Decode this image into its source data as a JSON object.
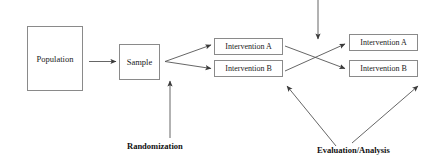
{
  "diagram": {
    "canvas": {
      "width": 440,
      "height": 167,
      "background": "#ffffff"
    },
    "stroke_color": "#555555",
    "box_border_color": "#8a8a8a",
    "text_color": "#1a1a1a",
    "nodes": {
      "population": "Population",
      "sample": "Sample",
      "mid_intervention_a": "Intervention A",
      "mid_intervention_b": "Intervention B",
      "right_intervention_a": "Intervention A",
      "right_intervention_b": "Intervention B"
    },
    "captions": {
      "randomization": "Randomization",
      "evaluation": "Evaluation/Analysis"
    },
    "edges": [
      {
        "name": "population-to-sample",
        "from": "population",
        "to": "sample",
        "style": "straight-arrow"
      },
      {
        "name": "sample-to-mid-a",
        "from": "sample",
        "to": "mid_intervention_a",
        "style": "straight-arrow"
      },
      {
        "name": "sample-to-mid-b",
        "from": "sample",
        "to": "mid_intervention_b",
        "style": "straight-arrow"
      },
      {
        "name": "randomization-to-sample",
        "from": "randomization",
        "to": "sample",
        "style": "straight-arrow"
      },
      {
        "name": "crossover-a-to-b",
        "from": "mid_intervention_a",
        "to": "right_intervention_b",
        "style": "straight-arrow"
      },
      {
        "name": "crossover-b-to-a",
        "from": "mid_intervention_b",
        "to": "right_intervention_a",
        "style": "straight-arrow"
      },
      {
        "name": "washout-top-inflow",
        "from": "top-edge",
        "to": "crossover-point",
        "style": "straight-arrow"
      },
      {
        "name": "evaluation-to-mid",
        "from": "evaluation",
        "to": "mid_intervention_b",
        "style": "straight-arrow"
      },
      {
        "name": "evaluation-to-right",
        "from": "evaluation",
        "to": "right_intervention_b",
        "style": "straight-arrow"
      }
    ]
  }
}
